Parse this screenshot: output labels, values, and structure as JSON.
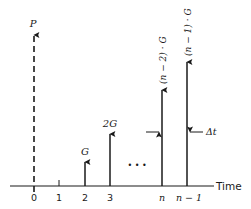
{
  "diagram": {
    "type": "gradient-cash-flow-diagram",
    "axis": {
      "label": "Time",
      "ticks": [
        {
          "label": "0",
          "x": 34
        },
        {
          "label": "1",
          "x": 59
        },
        {
          "label": "2",
          "x": 85
        },
        {
          "label": "3",
          "x": 110
        },
        {
          "label": "n",
          "x": 162
        },
        {
          "label": "n − 1",
          "x": 187
        }
      ]
    },
    "arrows": [
      {
        "id": "p",
        "label": "P",
        "x": 34,
        "top": 33,
        "style": "dashed"
      },
      {
        "id": "g",
        "label": "G",
        "x": 85,
        "top": 160,
        "style": "solid"
      },
      {
        "id": "2g",
        "label": "2G",
        "x": 110,
        "top": 132,
        "style": "solid"
      },
      {
        "id": "n-2g",
        "label": "(n − 2) · G",
        "x": 162,
        "top": 88,
        "style": "solid"
      },
      {
        "id": "n-1g",
        "label": "(n − 1) · G",
        "x": 187,
        "top": 60,
        "style": "solid"
      }
    ],
    "ellipsis": "• • •",
    "interval_marker": {
      "label": "Δt",
      "y": 132
    },
    "colors": {
      "ink": "#1a1a1a",
      "background": "#ffffff"
    }
  }
}
